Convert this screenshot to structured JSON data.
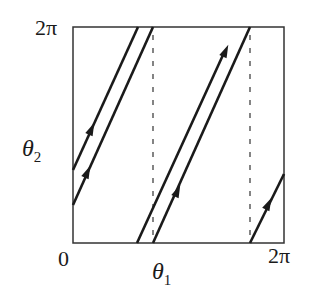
{
  "diagram": {
    "type": "torus-flow-phase-portrait",
    "x_axis": {
      "label_symbol": "θ",
      "label_sub": "1",
      "min_label": "0",
      "max_label": "2π"
    },
    "y_axis": {
      "label_symbol": "θ",
      "label_sub": "2",
      "min_label": "0",
      "max_label": "2π"
    },
    "box": {
      "left": 73,
      "top": 27,
      "right": 284,
      "bottom": 243
    },
    "trajectories": [
      {
        "id": "left-upper",
        "x1": 73,
        "y1": 170,
        "x2": 138,
        "y2": 27,
        "arrow": {
          "x": 91,
          "y": 130
        }
      },
      {
        "id": "left-lower",
        "x1": 73,
        "y1": 205,
        "x2": 153,
        "y2": 27,
        "arrow": {
          "x": 87,
          "y": 173
        }
      },
      {
        "id": "middle-left",
        "x1": 137,
        "y1": 243,
        "x2": 226,
        "y2": 48,
        "arrow": {
          "x": 226,
          "y": 48
        }
      },
      {
        "id": "middle-right",
        "x1": 153,
        "y1": 243,
        "x2": 250,
        "y2": 27,
        "arrow": {
          "x": 177,
          "y": 194
        }
      },
      {
        "id": "right",
        "x1": 250,
        "y1": 243,
        "x2": 284,
        "y2": 174,
        "arrow": {
          "x": 268,
          "y": 206
        }
      }
    ],
    "dashed_lines": [
      {
        "x": 153,
        "y1": 35,
        "y2": 243
      },
      {
        "x": 250,
        "y1": 35,
        "y2": 243
      }
    ],
    "colors": {
      "line": "#1a1a1a",
      "frame": "#333333",
      "dash": "#333333"
    }
  }
}
